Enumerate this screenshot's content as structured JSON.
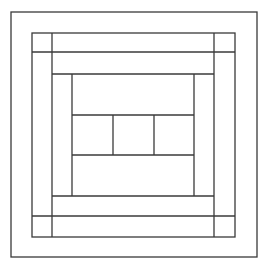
{
  "diagram": {
    "title": "",
    "stroke_color": "#3a3a3a",
    "background_color": "#ffffff",
    "center_cells": 3
  }
}
